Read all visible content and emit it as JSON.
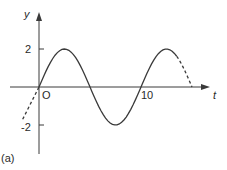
{
  "chart_data": {
    "type": "line",
    "title": "",
    "xlabel": "t",
    "ylabel": "y",
    "origin_label": "O",
    "panel_label": "(a)",
    "xticks": [
      {
        "value": 10,
        "label": "10"
      }
    ],
    "yticks": [
      {
        "value": 2,
        "label": "2"
      },
      {
        "value": -2,
        "label": "-2"
      }
    ],
    "xlim": [
      -1.5,
      16.5
    ],
    "ylim": [
      -3.5,
      3.7
    ],
    "grid": false,
    "series": [
      {
        "name": "y = 2 sin(2πt/10)",
        "style": "solid",
        "x": [
          0,
          1.25,
          2.5,
          3.75,
          5,
          6.25,
          7.5,
          8.75,
          10,
          11.25,
          12.5,
          13.5
        ],
        "values": [
          0,
          1.41,
          2,
          1.41,
          0,
          -1.41,
          -2,
          -1.41,
          0,
          1.41,
          2,
          1.62
        ]
      },
      {
        "name": "extension-right",
        "style": "dashed",
        "x": [
          13.5,
          14.25,
          15
        ],
        "values": [
          1.62,
          0.9,
          0
        ]
      },
      {
        "name": "extension-left",
        "style": "dashed",
        "x": [
          -1.6,
          -0.8,
          0
        ],
        "values": [
          -1.7,
          -0.97,
          0
        ]
      }
    ],
    "amplitude": 2,
    "period": 10
  },
  "colors": {
    "curve": "#3a3a3a",
    "axis": "#3a3a3a",
    "text": "#2a2a2a"
  }
}
